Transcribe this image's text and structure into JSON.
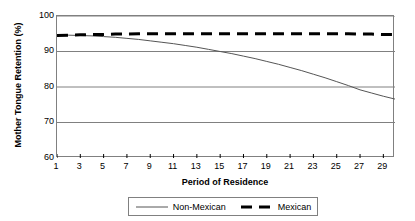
{
  "chart_data": {
    "type": "line",
    "title": "",
    "xlabel": "Period of Residence",
    "ylabel": "Mother Tongue Retention (%)",
    "xlim": [
      1,
      30
    ],
    "ylim": [
      60,
      100
    ],
    "grid": true,
    "legend_position": "bottom",
    "yticks": [
      60,
      70,
      80,
      90,
      100
    ],
    "ytick_labels": [
      "60",
      "70",
      "80",
      "90",
      "100"
    ],
    "xticks": [
      1,
      3,
      5,
      7,
      9,
      11,
      13,
      15,
      17,
      19,
      21,
      23,
      25,
      27,
      29
    ],
    "xtick_labels": [
      "1",
      "3",
      "5",
      "7",
      "9",
      "11",
      "13",
      "15",
      "17",
      "19",
      "21",
      "23",
      "25",
      "27",
      "29"
    ],
    "x": [
      1,
      2,
      3,
      4,
      5,
      6,
      7,
      8,
      9,
      10,
      11,
      12,
      13,
      14,
      15,
      16,
      17,
      18,
      19,
      20,
      21,
      22,
      23,
      24,
      25,
      26,
      27,
      28,
      29,
      30
    ],
    "series": [
      {
        "name": "Non-Mexican",
        "style": "solid",
        "width": "thin",
        "color": "#555555",
        "values": [
          94.6,
          94.6,
          94.5,
          94.4,
          94.2,
          94.0,
          93.7,
          93.4,
          93.0,
          92.6,
          92.2,
          91.7,
          91.2,
          90.6,
          90.0,
          89.4,
          88.7,
          88.0,
          87.2,
          86.4,
          85.5,
          84.6,
          83.6,
          82.6,
          81.5,
          80.4,
          79.2,
          78.3,
          77.4,
          76.6
        ]
      },
      {
        "name": "Mexican",
        "style": "dashed",
        "width": "thick",
        "color": "#000000",
        "values": [
          94.5,
          94.6,
          94.7,
          94.8,
          94.8,
          94.9,
          94.9,
          95.0,
          95.0,
          95.0,
          95.0,
          95.0,
          95.0,
          95.0,
          95.0,
          95.0,
          95.0,
          95.0,
          95.0,
          95.0,
          95.0,
          95.0,
          95.0,
          95.0,
          95.0,
          95.0,
          94.9,
          94.9,
          94.8,
          94.8
        ]
      }
    ]
  },
  "legend": {
    "entries": [
      {
        "label": "Non-Mexican"
      },
      {
        "label": "Mexican"
      }
    ]
  }
}
